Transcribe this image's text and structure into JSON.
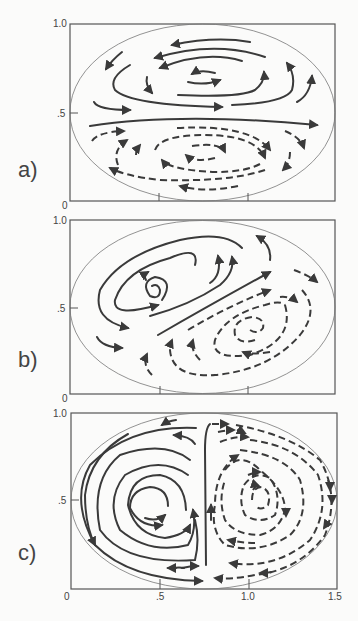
{
  "figure": {
    "panels": [
      {
        "label": "a)",
        "y_ticks": [
          "1.0",
          ".5",
          "0"
        ],
        "description": "Two zonally elongated gyres: solid-line (upper) circulation above mid-line, dashed-line (lower) circulation below; straight eastward jet along y=0.5"
      },
      {
        "label": "b)",
        "y_ticks": [
          "1.0",
          ".5",
          "0"
        ],
        "description": "Two tilted spiral gyres: solid spiral upper-left, dashed spiral lower-right, separated by a diagonal jet"
      },
      {
        "label": "c)",
        "y_ticks": [
          "1.0",
          ".5",
          "0"
        ],
        "x_ticks": [
          "0",
          ".5",
          "1.0",
          "1.5"
        ],
        "description": "Two side-by-side gyres: solid closed circulation on the left, dashed closed circulation on the right, separated by a meridional boundary near x=0.75"
      }
    ],
    "line_styles": {
      "solid": "upper-layer streamlines",
      "dashed": "lower-layer streamlines"
    },
    "colors": {
      "ink": "#3a3a3a",
      "frame": "#555555",
      "ellipse": "#777777",
      "background": "#fbfbfa"
    }
  }
}
